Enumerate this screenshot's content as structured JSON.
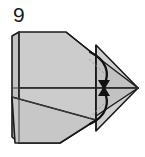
{
  "diagram": {
    "kind": "origami-fold-step",
    "step_number": "9",
    "background_color": "#ffffff",
    "paper_fill": "#cccccc",
    "paper_fill_shaded": "#c2c2c2",
    "paper_fill_light": "#d4d4d4",
    "outline_color": "#1a1a1a",
    "crease_color": "#3c3c3c",
    "arrow_color": "#111111",
    "guide_color": "#9a9a9a",
    "outline_width": 1.6,
    "crease_width": 1.0,
    "guide_width": 0.9,
    "arrow_width": 2.3
  },
  "shapes": {
    "body_upper": {
      "name": "upper-body-panel",
      "points": "19,32 66,32 96,56 96,88 19,88"
    },
    "body_lower": {
      "name": "lower-body-panel",
      "points": "19,88 96,88 96,120 60,143 19,143"
    },
    "body_lower_skirt": {
      "name": "lower-body-skirt",
      "points": "12,97 96,120 60,143 15,143"
    },
    "flap_upper": {
      "name": "upper-flap-triangle",
      "points": "96,45 138,88 96,88"
    },
    "flap_lower": {
      "name": "lower-flap-triangle",
      "points": "96,88 138,88 96,131"
    },
    "nose_upper": {
      "name": "nose-upper-wedge",
      "points": "96,56 138,88 96,88"
    },
    "nose_lower": {
      "name": "nose-lower-wedge",
      "points": "96,88 138,88 96,116"
    },
    "left_edge_fold": {
      "name": "left-edge-fold-strip",
      "points": "12,36 19,32 19,143 12,137"
    }
  },
  "creases": [
    {
      "name": "crease-horizontal-center",
      "d": "M 12,88 L 138,88"
    },
    {
      "name": "crease-lower-diagonal",
      "d": "M 12,97 L 96,120"
    },
    {
      "name": "crease-vertical-flap",
      "d": "M 96,45 L 96,131"
    },
    {
      "name": "crease-upper-body-edge",
      "d": "M 66,32 L 96,56"
    },
    {
      "name": "crease-left-spine",
      "d": "M 19,32 L 19,143"
    }
  ],
  "guides": [
    {
      "name": "guide-upper-dashed",
      "d": "M 89,59 L 104,73"
    },
    {
      "name": "guide-lower-dashed",
      "d": "M 89,118 L 104,104"
    }
  ],
  "arrows": [
    {
      "name": "fold-arrow-upper",
      "label": "fold upper flap down to center",
      "path": "M 90,52 C 107,60 110,74 104,85",
      "head": "104,90 98,80 110,80"
    },
    {
      "name": "fold-arrow-lower",
      "label": "fold lower flap up to center",
      "path": "M 90,124 C 107,116 110,102 104,91",
      "head": "104,86 98,96 110,96"
    }
  ],
  "labels": {
    "step_number": "9",
    "step_number_x": "13",
    "step_number_y": "22"
  }
}
